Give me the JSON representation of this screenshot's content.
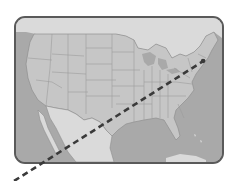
{
  "figure": {
    "type": "map",
    "top_text_partial": ""
  },
  "colors": {
    "background": "#ffffff",
    "frame_border": "#5a5a5a",
    "ocean": "#a9a9a9",
    "usa_land": "#c6c6c6",
    "state_borders": "#9c9c9c",
    "neighbor_land": "#dadada",
    "route_line": "#3a3a3a"
  },
  "route": {
    "style": "dashed",
    "start_label": "",
    "end_label": "",
    "start_px": [
      205,
      60
    ],
    "end_px": [
      14,
      181
    ],
    "description": "Dashed line from the northeastern US (New York area) heading southwest, crossing Mexico and exiting the frame bottom-left"
  }
}
